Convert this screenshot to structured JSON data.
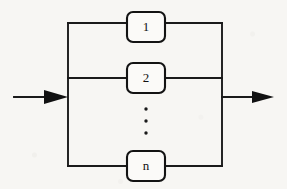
{
  "diagram": {
    "type": "reliability-block-diagram",
    "configuration": "parallel",
    "background_color": "#f7f6f3",
    "line_color": "#1a1a1a",
    "blocks": [
      {
        "id": "block-1",
        "label": "1",
        "x": 127,
        "y": 12,
        "width": 38,
        "height": 30
      },
      {
        "id": "block-2",
        "label": "2",
        "x": 127,
        "y": 63,
        "width": 38,
        "height": 30
      },
      {
        "id": "block-n",
        "label": "n",
        "x": 127,
        "y": 151,
        "width": 38,
        "height": 30
      }
    ],
    "ellipsis": {
      "name": "vertical-ellipsis",
      "dot_count": 3,
      "x": 146,
      "dot_y": [
        109,
        121,
        133
      ],
      "radius": 1.6
    },
    "bus": {
      "left_x": 68,
      "right_x": 222,
      "top_y": 23,
      "bottom_y": 166,
      "branch_rows_y": [
        23,
        78,
        166
      ]
    },
    "input_arrow": {
      "name": "input-arrow",
      "from_x": 14,
      "to_x": 68,
      "y": 97,
      "direction": "right"
    },
    "output_arrow": {
      "name": "output-arrow",
      "from_x": 222,
      "to_x": 274,
      "y": 97,
      "direction": "right"
    }
  }
}
